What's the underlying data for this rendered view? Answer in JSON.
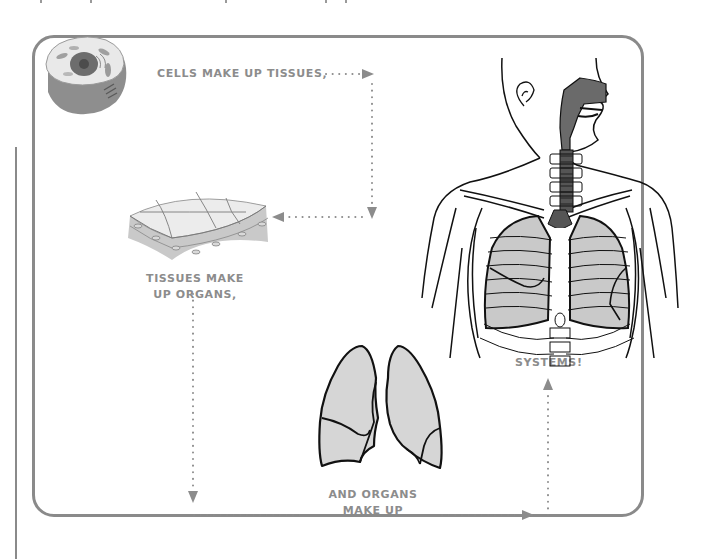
{
  "diagram": {
    "frame_color": "#8a8a8a",
    "label_color": "#8c8c8c",
    "arrow_color": "#8c8c8c",
    "organ_fill": "#d6d6d6",
    "steps": [
      {
        "id": "cells",
        "label": "CELLS MAKE UP TISSUES,",
        "illustration": "animal-cell"
      },
      {
        "id": "tissues",
        "label_line1": "TISSUES MAKE",
        "label_line2": "UP ORGANS,",
        "illustration": "tissue-layer"
      },
      {
        "id": "organs",
        "label_line1": "AND ORGANS",
        "label_line2": "MAKE UP",
        "illustration": "lungs"
      },
      {
        "id": "systems",
        "label": "SYSTEMS!",
        "illustration": "respiratory-system-torso"
      }
    ],
    "arrows": [
      {
        "from": "cells",
        "to": "tissues",
        "path": "right, down, left"
      },
      {
        "from": "tissues",
        "to": "organs",
        "path": "down, right"
      },
      {
        "from": "organs",
        "to": "systems",
        "path": "right, up"
      }
    ]
  }
}
